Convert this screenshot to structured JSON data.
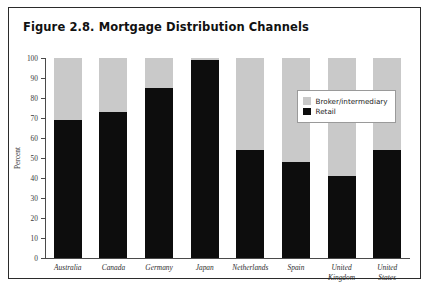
{
  "figure": {
    "title": "Figure 2.8. Mortgage Distribution Channels"
  },
  "legend": {
    "items": [
      {
        "label": "Broker/intermediary",
        "color": "#c9c9c9",
        "swatch_name": "broker-swatch"
      },
      {
        "label": "Retail",
        "color": "#0d0d0d",
        "swatch_name": "retail-swatch"
      }
    ]
  },
  "axes": {
    "ylabel": "Percent",
    "yticks": [
      0,
      10,
      20,
      30,
      40,
      50,
      60,
      70,
      80,
      90,
      100
    ]
  },
  "chart_data": {
    "type": "bar",
    "title": "Figure 2.8. Mortgage Distribution Channels",
    "subtitle": "",
    "stacked": true,
    "xlabel": "",
    "ylabel": "Percent",
    "ylim": [
      0,
      100
    ],
    "yticks": [
      0,
      10,
      20,
      30,
      40,
      50,
      60,
      70,
      80,
      90,
      100
    ],
    "grid": false,
    "legend_position": "upper right (inside plot area)",
    "categories": [
      "Australia",
      "Canada",
      "Germany",
      "Japan",
      "Netherlands",
      "Spain",
      "United Kingdom",
      "United States"
    ],
    "series": [
      {
        "name": "Retail",
        "color": "#0d0d0d",
        "values": [
          69,
          73,
          85,
          99,
          54,
          48,
          41,
          54
        ]
      },
      {
        "name": "Broker/intermediary",
        "color": "#c9c9c9",
        "values": [
          31,
          27,
          15,
          1,
          46,
          52,
          59,
          46
        ]
      }
    ]
  }
}
